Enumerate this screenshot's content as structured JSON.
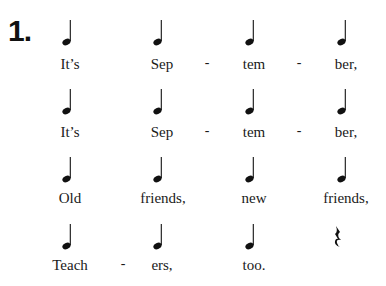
{
  "exercise": {
    "number": "1.",
    "rows": [
      {
        "beats": [
          {
            "type": "quarter-note",
            "lyric": "It’s"
          },
          {
            "type": "quarter-note",
            "lyric": "Sep"
          },
          {
            "type": "quarter-note",
            "lyric": "tem"
          },
          {
            "type": "quarter-note",
            "lyric": "ber,"
          }
        ],
        "hyphens": [
          "-",
          "-"
        ]
      },
      {
        "beats": [
          {
            "type": "quarter-note",
            "lyric": "It’s"
          },
          {
            "type": "quarter-note",
            "lyric": "Sep"
          },
          {
            "type": "quarter-note",
            "lyric": "tem"
          },
          {
            "type": "quarter-note",
            "lyric": "ber,"
          }
        ],
        "hyphens": [
          "-",
          "-"
        ]
      },
      {
        "beats": [
          {
            "type": "quarter-note",
            "lyric": "Old"
          },
          {
            "type": "quarter-note",
            "lyric": "friends,"
          },
          {
            "type": "quarter-note",
            "lyric": "new"
          },
          {
            "type": "quarter-note",
            "lyric": "friends,"
          }
        ],
        "hyphens": []
      },
      {
        "beats": [
          {
            "type": "quarter-note",
            "lyric": "Teach"
          },
          {
            "type": "quarter-note",
            "lyric": "ers,"
          },
          {
            "type": "quarter-note",
            "lyric": "too."
          },
          {
            "type": "quarter-rest",
            "lyric": ""
          }
        ],
        "hyphens": [
          "-"
        ]
      }
    ]
  }
}
